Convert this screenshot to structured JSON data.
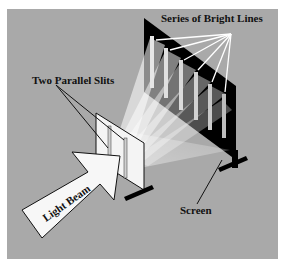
{
  "diagram": {
    "labels": {
      "bright_lines": "Series of Bright Lines",
      "slits": "Two Parallel Slits",
      "light_beam": "Light Beam",
      "screen": "Screen"
    },
    "colors": {
      "background": "#a9a9a9",
      "frame": "#ffffff",
      "screen": "#000000",
      "light": "#f2f2f2",
      "text": "#111111"
    },
    "bright_line_count": 6
  }
}
